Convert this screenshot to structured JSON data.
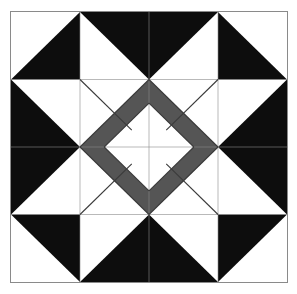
{
  "artwork": {
    "title": "Quilt Block Pattern",
    "kind": "pieced-quilt-block",
    "description": "Four-by-four pieced quilt block: dark half-square-triangle corners, dark flying-geese star points on each edge, and a gray square-in-a-square medallion with a white on-point center diamond.",
    "canvas": {
      "width": 297,
      "height": 294,
      "background": "#ffffff"
    },
    "frame": {
      "x": 10,
      "y": 11,
      "width": 278,
      "height": 272,
      "border_color": "#8a8a8a",
      "border_width": 1
    },
    "grid": {
      "columns": 4,
      "rows": 4,
      "cell_width": 69.5,
      "cell_height": 68.0,
      "gridline_color": "#8a8a8a"
    }
  },
  "palette": {
    "dark": "#0d0d0d",
    "gray": "#555555",
    "gray_shade": "#4e4e4e",
    "white": "#ffffff",
    "border": "#8a8a8a",
    "seam": "#3a3a3a"
  },
  "chart_data": {
    "type": "diagram",
    "xlabel": "",
    "ylabel": "",
    "categories": [
      "dark",
      "gray",
      "white"
    ],
    "values": [
      8,
      4,
      1
    ],
    "legend": [
      {
        "label": "dark",
        "color": "#0d0d0d",
        "patch_count": 8
      },
      {
        "label": "gray",
        "color": "#555555",
        "patch_count": 4
      },
      {
        "label": "white",
        "color": "#ffffff",
        "patch_count": 1
      }
    ],
    "units": "grid units (1 unit = 1/4 of block width)",
    "viewbox": [
      0,
      0,
      4,
      4
    ],
    "patches": [
      {
        "name": "corner-triangle-top-left",
        "fill": "dark",
        "points": "1,0 1,1 0,1"
      },
      {
        "name": "corner-triangle-top-right",
        "fill": "dark",
        "points": "3,0 4,1 3,1"
      },
      {
        "name": "corner-triangle-bottom-left",
        "fill": "dark",
        "points": "0,3 1,3 1,4"
      },
      {
        "name": "corner-triangle-bottom-right",
        "fill": "dark",
        "points": "3,3 4,3 3,4"
      },
      {
        "name": "star-point-top",
        "fill": "dark",
        "points": "1,0 3,0 2,1"
      },
      {
        "name": "star-point-bottom",
        "fill": "dark",
        "points": "1,4 2,3 3,4"
      },
      {
        "name": "star-point-left",
        "fill": "dark",
        "points": "0,1 1,2 0,3"
      },
      {
        "name": "star-point-right",
        "fill": "dark",
        "points": "4,1 4,3 3,2"
      },
      {
        "name": "gray-diamond-top",
        "fill": "gray",
        "points": "2,1 2.75,1.75 2,2.5 1.25,1.75"
      },
      {
        "name": "gray-diamond-right",
        "fill": "gray",
        "points": "3,2 2.25,2.75 1.5,2 2.25,1.25"
      },
      {
        "name": "gray-diamond-bottom",
        "fill": "gray",
        "points": "2,3 1.25,2.25 2,1.5 2.75,2.25"
      },
      {
        "name": "gray-diamond-left",
        "fill": "gray",
        "points": "1,2 1.75,1.25 2.5,2 1.75,2.75"
      },
      {
        "name": "center-diamond",
        "fill": "white",
        "points": "2,1.35 2.65,2 2,2.65 1.35,2"
      }
    ],
    "seams": [
      {
        "name": "seam-medallion-top-left",
        "path": "M1,2 L2,1"
      },
      {
        "name": "seam-medallion-top-right",
        "path": "M2,1 L3,2"
      },
      {
        "name": "seam-medallion-bottom-right",
        "path": "M3,2 L2,3"
      },
      {
        "name": "seam-medallion-bottom-left",
        "path": "M2,3 L1,2"
      },
      {
        "name": "seam-center-top-left",
        "path": "M1.35,2 L2,1.35"
      },
      {
        "name": "seam-center-top-right",
        "path": "M2,1.35 L2.65,2"
      },
      {
        "name": "seam-center-bottom-right",
        "path": "M2.65,2 L2,2.65"
      },
      {
        "name": "seam-center-bottom-left",
        "path": "M2,2.65 L1.35,2"
      },
      {
        "name": "seam-diag-nw",
        "path": "M1,1 L1.75,1.75"
      },
      {
        "name": "seam-diag-ne",
        "path": "M3,1 L2.25,1.75"
      },
      {
        "name": "seam-diag-se",
        "path": "M3,3 L2.25,2.25"
      },
      {
        "name": "seam-diag-sw",
        "path": "M1,3 L1.75,2.25"
      }
    ],
    "gridlines": [
      {
        "name": "gridline-v-1",
        "path": "M1,0 L1,4"
      },
      {
        "name": "gridline-v-2",
        "path": "M2,0 L2,4"
      },
      {
        "name": "gridline-v-3",
        "path": "M3,0 L3,4"
      },
      {
        "name": "gridline-h-1",
        "path": "M0,1 L4,1"
      },
      {
        "name": "gridline-h-2",
        "path": "M0,2 L4,2"
      },
      {
        "name": "gridline-h-3",
        "path": "M0,3 L4,3"
      }
    ]
  }
}
